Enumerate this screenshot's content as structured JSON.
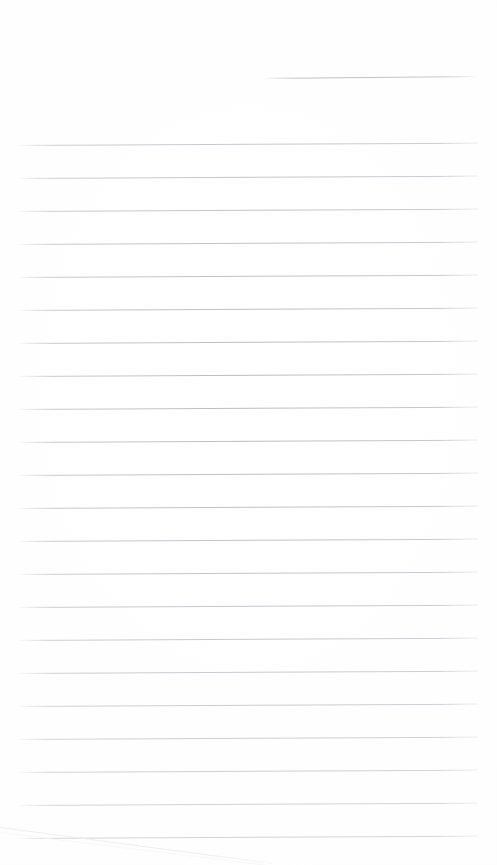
{
  "document": {
    "type": "scanned-ruled-paper",
    "description": "Blank lined notebook page scan",
    "width": 497,
    "height": 865,
    "background_color": "#ffffff",
    "rule_color": "#b9bcc2",
    "header_rule_color": "#a9adb4",
    "page_edge_color": "#dfe1e5",
    "text_content": ""
  },
  "header_rule": {
    "x": 263,
    "y": 78,
    "width": 215,
    "angle_deg": -0.55
  },
  "rules": {
    "count": 22,
    "first_y": 145,
    "spacing": 33,
    "x": 17,
    "width": 461,
    "angle_deg": -0.28,
    "lines": [
      {
        "index": 1,
        "y": 145
      },
      {
        "index": 2,
        "y": 178
      },
      {
        "index": 3,
        "y": 211
      },
      {
        "index": 4,
        "y": 244
      },
      {
        "index": 5,
        "y": 277
      },
      {
        "index": 6,
        "y": 310
      },
      {
        "index": 7,
        "y": 343
      },
      {
        "index": 8,
        "y": 376
      },
      {
        "index": 9,
        "y": 409
      },
      {
        "index": 10,
        "y": 442
      },
      {
        "index": 11,
        "y": 475
      },
      {
        "index": 12,
        "y": 508
      },
      {
        "index": 13,
        "y": 541
      },
      {
        "index": 14,
        "y": 574
      },
      {
        "index": 15,
        "y": 607
      },
      {
        "index": 16,
        "y": 640
      },
      {
        "index": 17,
        "y": 673
      },
      {
        "index": 18,
        "y": 706
      },
      {
        "index": 19,
        "y": 739
      },
      {
        "index": 20,
        "y": 772
      },
      {
        "index": 21,
        "y": 805
      },
      {
        "index": 22,
        "y": 838
      }
    ]
  },
  "page_edge": {
    "start_x": 0,
    "start_y": 827,
    "end_x": 272,
    "end_y": 863,
    "length": 274,
    "angle_deg": 7.5
  },
  "page_edge_shadow": {
    "start_x": 0,
    "start_y": 832,
    "end_x": 268,
    "end_y": 865,
    "length": 270,
    "angle_deg": 7.0
  }
}
